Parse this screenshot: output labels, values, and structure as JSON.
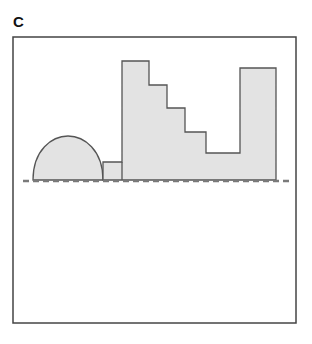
{
  "panel": {
    "label": "C"
  },
  "colors": {
    "frame": "#444444",
    "shape_fill": "#e3e3e3",
    "shape_stroke": "#555555",
    "dashed_line": "#7a7a7a",
    "background": "#ffffff"
  },
  "diagram": {
    "frame": {
      "x": 13,
      "y": 37,
      "width": 283,
      "height": 286
    },
    "baseline": {
      "y": 181,
      "x1": 23,
      "x2": 292,
      "style": "dashed"
    },
    "shapes": [
      {
        "type": "semicircle-dome",
        "x1": 33,
        "x2": 103,
        "top": 136,
        "base": 180
      },
      {
        "type": "step-profile",
        "points": [
          [
            103,
            180
          ],
          [
            103,
            162
          ],
          [
            122,
            162
          ],
          [
            122,
            61
          ],
          [
            149,
            61
          ],
          [
            149,
            85
          ],
          [
            167,
            85
          ],
          [
            167,
            108
          ],
          [
            185,
            108
          ],
          [
            185,
            132
          ],
          [
            206,
            132
          ],
          [
            206,
            153
          ],
          [
            240,
            153
          ],
          [
            240,
            68
          ],
          [
            276,
            68
          ],
          [
            276,
            180
          ]
        ]
      }
    ]
  }
}
